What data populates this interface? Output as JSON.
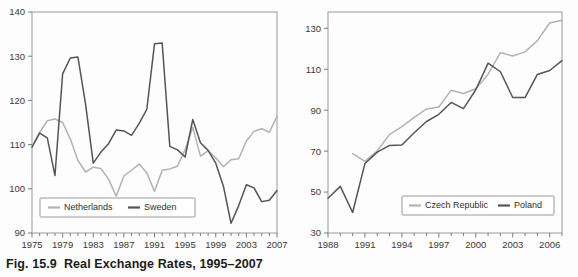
{
  "caption": {
    "figure_number": "Fig. 15.9",
    "title": "Real Exchange Rates, 1995–2007"
  },
  "chart_data": [
    {
      "id": "left",
      "type": "line",
      "title": "",
      "xlabel": "",
      "ylabel": "",
      "xlim": [
        1975,
        2007
      ],
      "ylim": [
        90,
        140
      ],
      "ytick_labels": [
        "90",
        "100",
        "110",
        "120",
        "130",
        "140"
      ],
      "yticks": [
        90,
        100,
        110,
        120,
        130,
        140
      ],
      "xtick_labels": [
        "1975",
        "1979",
        "1983",
        "1987",
        "1991",
        "1995",
        "1999",
        "2003",
        "2007"
      ],
      "xticks": [
        1975,
        1979,
        1983,
        1987,
        1991,
        1995,
        1999,
        2003,
        2007
      ],
      "minor_xticks_every": 1,
      "grid": false,
      "legend_position": "lower-left-inside",
      "x": [
        1975,
        1976,
        1977,
        1978,
        1979,
        1980,
        1981,
        1982,
        1983,
        1984,
        1985,
        1986,
        1987,
        1988,
        1989,
        1990,
        1991,
        1992,
        1993,
        1994,
        1995,
        1996,
        1997,
        1998,
        1999,
        2000,
        2001,
        2002,
        2003,
        2004,
        2005,
        2006,
        2007
      ],
      "series": [
        {
          "name": "Netherlands",
          "color": "#b3b3b3",
          "values": [
            109.6,
            112.8,
            115.4,
            115.8,
            115.0,
            111.3,
            106.4,
            103.8,
            104.9,
            104.6,
            102.2,
            98.3,
            102.9,
            104.2,
            105.6,
            103.6,
            99.4,
            104.2,
            104.5,
            105.1,
            108.9,
            113.9,
            107.4,
            108.6,
            107.0,
            105.0,
            106.6,
            106.8,
            110.8,
            113.0,
            113.6,
            112.8,
            116.4
          ]
        },
        {
          "name": "Sweden",
          "color": "#555555",
          "values": [
            109.4,
            112.6,
            111.5,
            103.0,
            126.0,
            129.6,
            129.8,
            119.1,
            105.8,
            108.3,
            110.2,
            113.3,
            113.1,
            112.1,
            114.8,
            118.0,
            132.8,
            133.0,
            109.6,
            108.8,
            107.2,
            115.7,
            110.4,
            108.7,
            105.8,
            100.6,
            92.2,
            96.2,
            100.9,
            100.2,
            97.1,
            97.4,
            99.6
          ]
        }
      ]
    },
    {
      "id": "right",
      "type": "line",
      "title": "",
      "xlabel": "",
      "ylabel": "",
      "xlim": [
        1988,
        2007
      ],
      "ylim": [
        30,
        138
      ],
      "ytick_labels": [
        "30",
        "50",
        "70",
        "90",
        "110",
        "130"
      ],
      "yticks": [
        30,
        50,
        70,
        90,
        110,
        130
      ],
      "xtick_labels": [
        "1988",
        "1991",
        "1994",
        "1997",
        "2000",
        "2003",
        "2006"
      ],
      "xticks": [
        1988,
        1991,
        1994,
        1997,
        2000,
        2003,
        2006
      ],
      "minor_xticks_every": 1,
      "grid": false,
      "legend_position": "lower-right-inside",
      "x": [
        1988,
        1989,
        1990,
        1991,
        1992,
        1993,
        1994,
        1995,
        1996,
        1997,
        1998,
        1999,
        2000,
        2001,
        2002,
        2003,
        2004,
        2005,
        2006,
        2007
      ],
      "series": [
        {
          "name": "Czech Republic",
          "color": "#b3b3b3",
          "values": [
            null,
            null,
            68.8,
            65.0,
            70.2,
            78.2,
            82.0,
            86.5,
            90.6,
            91.6,
            99.8,
            98.2,
            100.5,
            107.6,
            118.2,
            116.5,
            118.5,
            124.0,
            132.6,
            134.0
          ]
        },
        {
          "name": "Poland",
          "color": "#555555",
          "values": [
            47.0,
            52.8,
            40.0,
            64.0,
            69.5,
            72.8,
            73.0,
            79.0,
            84.5,
            88.0,
            93.8,
            90.8,
            100.0,
            113.0,
            108.8,
            96.2,
            96.2,
            107.5,
            109.4,
            114.2
          ]
        }
      ]
    }
  ],
  "legends": {
    "left": [
      {
        "label": "Netherlands",
        "color": "#b3b3b3"
      },
      {
        "label": "Sweden",
        "color": "#555555"
      }
    ],
    "right": [
      {
        "label": "Czech Republic",
        "color": "#b3b3b3"
      },
      {
        "label": "Poland",
        "color": "#555555"
      }
    ]
  },
  "colors": {
    "light_series": "#b3b3b3",
    "dark_series": "#555555",
    "frame": "#9a9a9a",
    "text": "#2e2e2e",
    "background": "#fdfdfd"
  }
}
